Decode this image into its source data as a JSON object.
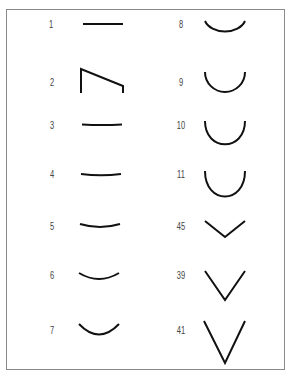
{
  "figure": {
    "left_column": [
      {
        "label": "1",
        "shape": "straight-line"
      },
      {
        "label": "2",
        "shape": "bracket-slant"
      },
      {
        "label": "3",
        "shape": "nearly-straight-curve"
      },
      {
        "label": "4",
        "shape": "slight-curve"
      },
      {
        "label": "5",
        "shape": "shallow-curve"
      },
      {
        "label": "6",
        "shape": "curve"
      },
      {
        "label": "7",
        "shape": "deeper-curve"
      }
    ],
    "right_column": [
      {
        "label": "8",
        "shape": "semicircle-shallow"
      },
      {
        "label": "9",
        "shape": "semicircle"
      },
      {
        "label": "10",
        "shape": "u-curve"
      },
      {
        "label": "11",
        "shape": "deep-u-curve"
      },
      {
        "label": "45",
        "shape": "wide-v"
      },
      {
        "label": "39",
        "shape": "v"
      },
      {
        "label": "41",
        "shape": "narrow-v"
      }
    ]
  }
}
